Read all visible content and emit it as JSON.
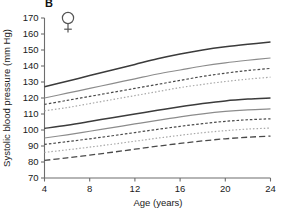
{
  "panel": {
    "label": "B",
    "sex_symbol": "venus-female-symbol"
  },
  "chart_data": {
    "type": "line",
    "title": "",
    "subtitle": "",
    "xlabel": "Age (years)",
    "ylabel": "Systolic blood pressure (mm Hg)",
    "xlim": [
      4,
      24
    ],
    "ylim": [
      70,
      170
    ],
    "xticks": [
      4,
      8,
      12,
      16,
      20,
      24
    ],
    "yticks": [
      70,
      80,
      90,
      100,
      110,
      120,
      130,
      140,
      150,
      160,
      170
    ],
    "xtick_labels": [
      "4",
      "8",
      "12",
      "16",
      "20",
      "24"
    ],
    "ytick_labels": [
      "70",
      "80",
      "90",
      "100",
      "110",
      "120",
      "130",
      "140",
      "150",
      "160",
      "170"
    ],
    "grid": false,
    "legend": "none",
    "legend_position": "none",
    "annotations": [
      "B",
      "female symbol"
    ],
    "x": [
      4,
      6,
      8,
      10,
      12,
      14,
      16,
      18,
      20,
      22,
      24
    ],
    "series": [
      {
        "name": "upper-band-solid-thick",
        "style": "solid-thick",
        "color": "#3b3b3b",
        "values": [
          127,
          130.5,
          134,
          137.5,
          141,
          144.5,
          147.5,
          150,
          152,
          153.6,
          155
        ]
      },
      {
        "name": "upper-band-solid-thin",
        "style": "solid-thin",
        "color": "#8c8c8c",
        "values": [
          120,
          123,
          126,
          129,
          132,
          135,
          137.5,
          140,
          142,
          143.6,
          145
        ]
      },
      {
        "name": "upper-band-dashed",
        "style": "dashed",
        "color": "#4a4a4a",
        "values": [
          116,
          118.5,
          121,
          123.5,
          126,
          128.5,
          131,
          133.5,
          135.5,
          137.2,
          138.5
        ]
      },
      {
        "name": "upper-band-dotted",
        "style": "dotted",
        "color": "#a8a8a8",
        "values": [
          112,
          114,
          116.5,
          119,
          121.5,
          124,
          126.5,
          128.5,
          130.3,
          131.8,
          133
        ]
      },
      {
        "name": "lower-band-solid-thick",
        "style": "solid-thick",
        "color": "#3b3b3b",
        "values": [
          101,
          103,
          105.3,
          107.7,
          110,
          112.3,
          114.5,
          116.5,
          118.2,
          119.3,
          120
        ]
      },
      {
        "name": "lower-band-solid-thin",
        "style": "solid-thin",
        "color": "#8c8c8c",
        "values": [
          95,
          97,
          99.2,
          101.5,
          103.8,
          106,
          108.2,
          110.1,
          111.6,
          112.6,
          113.2
        ]
      },
      {
        "name": "lower-band-dashed",
        "style": "dashed",
        "color": "#4a4a4a",
        "values": [
          91,
          92.7,
          94.5,
          96.4,
          98.4,
          100.4,
          102.3,
          104,
          105.4,
          106.4,
          107
        ]
      },
      {
        "name": "lower-band-dotted",
        "style": "dotted",
        "color": "#a8a8a8",
        "values": [
          86,
          87.6,
          89.3,
          91.1,
          93,
          94.9,
          96.7,
          98.3,
          99.6,
          100.6,
          101.2
        ]
      },
      {
        "name": "lowest-band-longdash",
        "style": "long-dash",
        "color": "#4a4a4a",
        "values": [
          81,
          82.6,
          84.3,
          86.1,
          88,
          89.9,
          91.6,
          93.2,
          94.5,
          95.5,
          96.2
        ]
      }
    ]
  }
}
